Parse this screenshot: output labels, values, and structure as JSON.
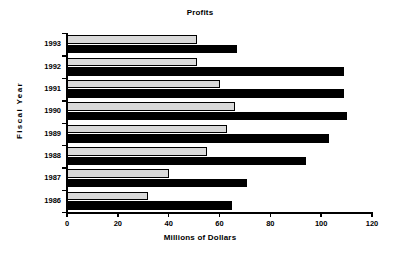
{
  "chart_data": {
    "type": "bar",
    "orientation": "horizontal",
    "title": "Profits",
    "xlabel": "Millions of Dollars",
    "ylabel": "Fiscal Year",
    "categories": [
      "1993",
      "1992",
      "1991",
      "1990",
      "1989",
      "1988",
      "1987",
      "1986"
    ],
    "series": [
      {
        "name": "gray-series",
        "color": "#d9d9d9",
        "values": [
          51,
          51,
          60,
          66,
          63,
          55,
          40,
          32
        ]
      },
      {
        "name": "black-series",
        "color": "#000000",
        "values": [
          67,
          109,
          109,
          110,
          103,
          94,
          71,
          65
        ]
      }
    ],
    "xlim": [
      0,
      120
    ],
    "xticks": [
      0,
      20,
      40,
      60,
      80,
      100,
      120
    ],
    "xtick_labels": [
      "0",
      "20",
      "40",
      "60",
      "80",
      "100",
      "120"
    ],
    "grid": false,
    "legend": false,
    "legend_position": "none"
  }
}
